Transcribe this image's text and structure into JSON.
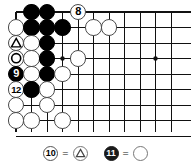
{
  "diagram": {
    "type": "go-board-problem-diagram",
    "board": {
      "cols": 11,
      "rows": 9,
      "origin_x": 16,
      "origin_y": 12,
      "spacing": 15.5,
      "edges": {
        "top": true,
        "left": true,
        "bottom": false,
        "right": false
      },
      "star_points": [
        {
          "col": 3,
          "row": 3
        },
        {
          "col": 9,
          "row": 3
        }
      ]
    },
    "stones": [
      {
        "col": 1,
        "row": 0,
        "color": "black",
        "label": "",
        "mark": ""
      },
      {
        "col": 2,
        "row": 0,
        "color": "black",
        "label": "",
        "mark": ""
      },
      {
        "col": 4,
        "row": 0,
        "color": "white",
        "label": "8",
        "mark": ""
      },
      {
        "col": 0,
        "row": 1,
        "color": "white",
        "label": "",
        "mark": ""
      },
      {
        "col": 1,
        "row": 1,
        "color": "black",
        "label": "",
        "mark": ""
      },
      {
        "col": 2,
        "row": 1,
        "color": "black",
        "label": "",
        "mark": ""
      },
      {
        "col": 3,
        "row": 1,
        "color": "black",
        "label": "",
        "mark": ""
      },
      {
        "col": 5,
        "row": 1,
        "color": "white",
        "label": "",
        "mark": ""
      },
      {
        "col": 6,
        "row": 1,
        "color": "white",
        "label": "",
        "mark": ""
      },
      {
        "col": 0,
        "row": 2,
        "color": "white",
        "label": "",
        "mark": "triangle"
      },
      {
        "col": 1,
        "row": 2,
        "color": "white",
        "label": "",
        "mark": ""
      },
      {
        "col": 2,
        "row": 2,
        "color": "black",
        "label": "",
        "mark": ""
      },
      {
        "col": 0,
        "row": 3,
        "color": "white",
        "label": "",
        "mark": "circle"
      },
      {
        "col": 1,
        "row": 3,
        "color": "white",
        "label": "",
        "mark": ""
      },
      {
        "col": 2,
        "row": 3,
        "color": "black",
        "label": "",
        "mark": ""
      },
      {
        "col": 4,
        "row": 3,
        "color": "white",
        "label": "",
        "mark": ""
      },
      {
        "col": 0,
        "row": 4,
        "color": "black",
        "label": "9",
        "mark": ""
      },
      {
        "col": 1,
        "row": 4,
        "color": "white",
        "label": "",
        "mark": ""
      },
      {
        "col": 2,
        "row": 4,
        "color": "black",
        "label": "",
        "mark": ""
      },
      {
        "col": 3,
        "row": 4,
        "color": "white",
        "label": "",
        "mark": ""
      },
      {
        "col": 0,
        "row": 5,
        "color": "white",
        "label": "12",
        "mark": ""
      },
      {
        "col": 1,
        "row": 5,
        "color": "black",
        "label": "",
        "mark": ""
      },
      {
        "col": 2,
        "row": 5,
        "color": "white",
        "label": "",
        "mark": ""
      },
      {
        "col": 0,
        "row": 6,
        "color": "white",
        "label": "",
        "mark": ""
      },
      {
        "col": 2,
        "row": 6,
        "color": "white",
        "label": "",
        "mark": ""
      },
      {
        "col": 0,
        "row": 7,
        "color": "white",
        "label": "",
        "mark": ""
      },
      {
        "col": 1,
        "row": 7,
        "color": "white",
        "label": "",
        "mark": ""
      },
      {
        "col": 3,
        "row": 7,
        "color": "white",
        "label": "",
        "mark": ""
      }
    ]
  },
  "caption": {
    "items": [
      {
        "move_label": "10",
        "move_stone_color": "white",
        "equals": "=",
        "target_stone_color": "white",
        "target_mark": "triangle"
      },
      {
        "move_label": "11",
        "move_stone_color": "black",
        "equals": "=",
        "target_stone_color": "white",
        "target_mark": "none"
      }
    ]
  },
  "colors": {
    "line": "#111111",
    "black_stone": "#000000",
    "white_stone": "#ffffff",
    "white_stone_border": "#4a4a4a",
    "background": "#ffffff"
  }
}
